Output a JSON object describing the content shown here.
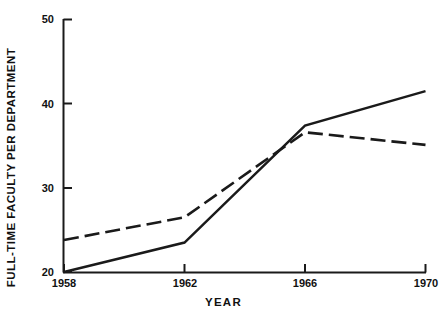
{
  "chart_data": {
    "type": "line",
    "title": "",
    "xlabel": "YEAR",
    "ylabel": "FULL-TIME FACULTY PER DEPARTMENT",
    "x": [
      1958,
      1962,
      1966,
      1970
    ],
    "xticks": [
      "1958",
      "1962",
      "1966",
      "1970"
    ],
    "yticks": [
      "20",
      "30",
      "40",
      "50"
    ],
    "ytick_values": [
      20,
      30,
      40,
      50
    ],
    "xlim": [
      1958,
      1970
    ],
    "ylim": [
      20,
      50
    ],
    "grid": false,
    "legend": "none",
    "series": [
      {
        "name": "solid-series",
        "style": "solid",
        "color": "#1a1a1a",
        "values": [
          20.0,
          23.5,
          37.4,
          41.5
        ]
      },
      {
        "name": "dashed-series",
        "style": "dashed",
        "color": "#1a1a1a",
        "values": [
          23.8,
          26.5,
          36.6,
          35.1
        ]
      }
    ]
  },
  "axes": {
    "y_tick_0": "20",
    "y_tick_1": "30",
    "y_tick_2": "40",
    "y_tick_3": "50",
    "x_tick_0": "1958",
    "x_tick_1": "1962",
    "x_tick_2": "1966",
    "x_tick_3": "1970",
    "x_axis_title": "YEAR",
    "y_axis_title": "FULL-TIME FACULTY PER DEPARTMENT"
  }
}
